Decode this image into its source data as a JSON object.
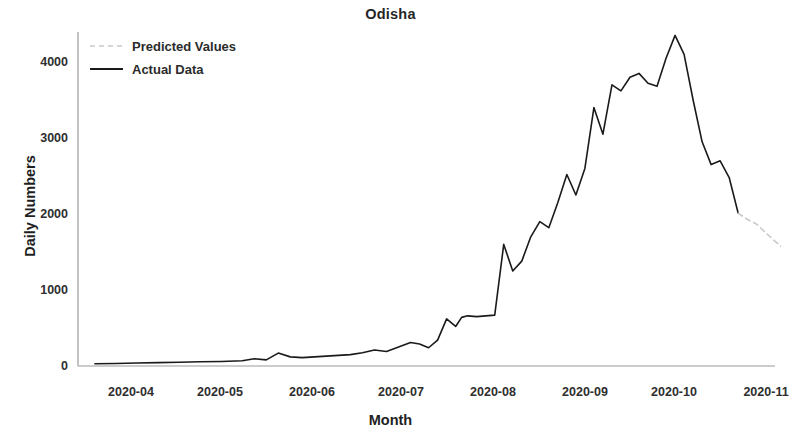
{
  "chart_data": {
    "type": "line",
    "title": "Odisha",
    "xlabel": "Month",
    "ylabel": "Daily Numbers",
    "grid": false,
    "legend_position": "upper left",
    "ylim": [
      -150,
      4500
    ],
    "yticks": [
      0,
      1000,
      2000,
      3000,
      4000
    ],
    "ytick_labels": [
      "0",
      "1000",
      "2000",
      "3000",
      "4000"
    ],
    "xticks": [
      "2020-04",
      "2020-05",
      "2020-06",
      "2020-07",
      "2020-08",
      "2020-09",
      "2020-10",
      "2020-11"
    ],
    "xlim": [
      "2020-03-15",
      "2020-11-10"
    ],
    "series": [
      {
        "name": "Actual Data",
        "style": "solid",
        "color": "#1a1a1a",
        "x": [
          "2020-03-20",
          "2020-03-27",
          "2020-04-03",
          "2020-04-10",
          "2020-04-17",
          "2020-04-24",
          "2020-05-01",
          "2020-05-08",
          "2020-05-12",
          "2020-05-16",
          "2020-05-20",
          "2020-05-24",
          "2020-05-28",
          "2020-06-01",
          "2020-06-05",
          "2020-06-09",
          "2020-06-13",
          "2020-06-17",
          "2020-06-21",
          "2020-06-25",
          "2020-06-29",
          "2020-07-03",
          "2020-07-06",
          "2020-07-09",
          "2020-07-12",
          "2020-07-15",
          "2020-07-18",
          "2020-07-20",
          "2020-07-22",
          "2020-07-25",
          "2020-07-28",
          "2020-07-31",
          "2020-08-03",
          "2020-08-06",
          "2020-08-09",
          "2020-08-12",
          "2020-08-15",
          "2020-08-18",
          "2020-08-21",
          "2020-08-24",
          "2020-08-27",
          "2020-08-30",
          "2020-09-02",
          "2020-09-05",
          "2020-09-08",
          "2020-09-11",
          "2020-09-14",
          "2020-09-17",
          "2020-09-20",
          "2020-09-23",
          "2020-09-26",
          "2020-09-29",
          "2020-10-02",
          "2020-10-05",
          "2020-10-08",
          "2020-10-11",
          "2020-10-14",
          "2020-10-17",
          "2020-10-20"
        ],
        "values": [
          30,
          32,
          40,
          45,
          50,
          55,
          60,
          70,
          95,
          80,
          170,
          120,
          110,
          120,
          130,
          140,
          150,
          175,
          210,
          190,
          250,
          310,
          290,
          240,
          340,
          620,
          520,
          640,
          660,
          650,
          660,
          670,
          1600,
          1250,
          1380,
          1700,
          1900,
          1820,
          2150,
          2520,
          2250,
          2600,
          3400,
          3050,
          3700,
          3620,
          3800,
          3850,
          3720,
          3680,
          4050,
          4350,
          4100,
          3500,
          2950,
          2650,
          2700,
          2480,
          2010
        ]
      },
      {
        "name": "Predicted Values",
        "style": "dashed",
        "color": "#c9c9c9",
        "x": [
          "2020-10-20",
          "2020-10-23",
          "2020-10-26",
          "2020-10-29",
          "2020-11-01",
          "2020-11-04"
        ],
        "values": [
          2010,
          1930,
          1870,
          1760,
          1650,
          1550
        ]
      }
    ]
  },
  "legend": {
    "items": [
      {
        "label": "Predicted Values",
        "style": "dashed",
        "color": "#c9c9c9"
      },
      {
        "label": "Actual Data",
        "style": "solid",
        "color": "#1a1a1a"
      }
    ]
  },
  "axis": {
    "ytick_0": "0",
    "ytick_1": "1000",
    "ytick_2": "2000",
    "ytick_3": "3000",
    "ytick_4": "4000",
    "xtick_0": "2020-04",
    "xtick_1": "2020-05",
    "xtick_2": "2020-06",
    "xtick_3": "2020-07",
    "xtick_4": "2020-08",
    "xtick_5": "2020-09",
    "xtick_6": "2020-10",
    "xtick_7": "2020-11"
  }
}
